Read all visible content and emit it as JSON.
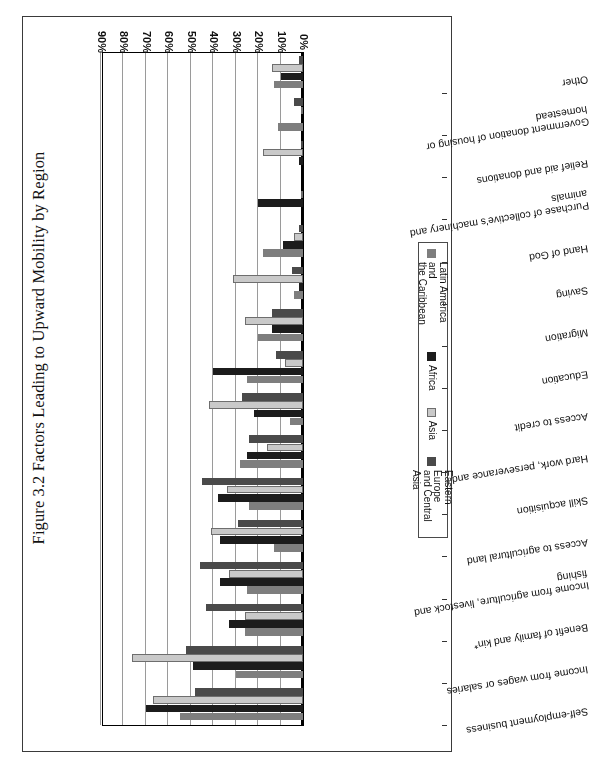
{
  "figure": {
    "title": "Figure 3.2 Factors Leading to Upward Mobility by Region"
  },
  "legend": {
    "position": "bottom-right",
    "entries": [
      {
        "label": "Latin America and\nthe Caribbean",
        "color": "#7e7e7e"
      },
      {
        "label": "Africa",
        "color": "#1c1c1c"
      },
      {
        "label": "Asia",
        "color": "#c9c9c9"
      },
      {
        "label": "Eastern Europe\nand Central Asia",
        "color": "#4a4a4a"
      }
    ]
  },
  "axis": {
    "ticks": [
      "0%",
      "10%",
      "20%",
      "30%",
      "40%",
      "50%",
      "60%",
      "70%",
      "80%",
      "90%"
    ],
    "min": 0,
    "max": 90
  },
  "footnote": "*",
  "chart_data": {
    "type": "bar",
    "orientation": "horizontal",
    "title": "Figure 3.2 Factors Leading to Upward Mobility by Region",
    "xlabel": "",
    "ylabel": "",
    "xlim": [
      0,
      90
    ],
    "grid": true,
    "legend_position": "bottom-right",
    "categories": [
      "Self-employment business",
      "Income from wages or salaries",
      "Benefit of family and kin*",
      "Income from agriculture, livestock and fishing",
      "Access to agricultural land",
      "Skill acquisition",
      "Hard work, perseverance and thrift",
      "Access to credit",
      "Education",
      "Migration",
      "Saving",
      "Hand of God",
      "Purchase of collective's machinery and animals",
      "Relief aid and donations",
      "Government donation of housing or homestead",
      "Other"
    ],
    "series": [
      {
        "name": "Latin America and the Caribbean",
        "color": "#7e7e7e",
        "values": [
          55,
          30,
          26,
          25,
          13,
          24,
          28,
          6,
          25,
          20,
          4,
          18,
          0,
          0,
          11,
          13
        ]
      },
      {
        "name": "Africa",
        "color": "#1c1c1c",
        "values": [
          70,
          49,
          33,
          37,
          37,
          38,
          25,
          22,
          40,
          14,
          2,
          9,
          20,
          2,
          0,
          10
        ]
      },
      {
        "name": "Asia",
        "color": "#c9c9c9",
        "values": [
          67,
          76,
          26,
          33,
          41,
          34,
          16,
          42,
          8,
          26,
          31,
          4,
          0,
          18,
          0,
          14
        ]
      },
      {
        "name": "Eastern Europe and Central Asia",
        "color": "#4a4a4a",
        "values": [
          48,
          52,
          43,
          46,
          29,
          45,
          24,
          27,
          12,
          14,
          5,
          2,
          0,
          1,
          4,
          2
        ]
      }
    ]
  }
}
